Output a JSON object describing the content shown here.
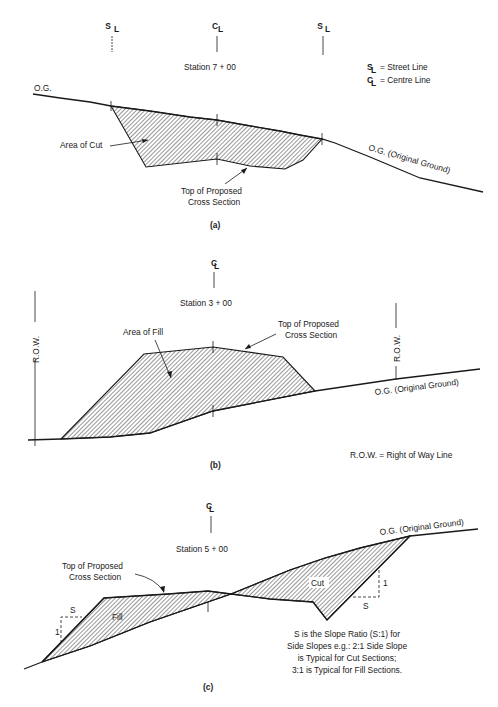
{
  "figure_a": {
    "caption": "(a)",
    "station": "Station 7 + 00",
    "left_marker": "SL",
    "center_marker": "CL",
    "right_marker": "SL",
    "og_left_label": "O.G.",
    "og_right_label": "O.G. (Original Ground)",
    "area_label": "Area of Cut",
    "top_label_line1": "Top of Proposed",
    "top_label_line2": "Cross Section",
    "legend": [
      {
        "symbol": "SL",
        "text": "= Street Line"
      },
      {
        "symbol": "CL",
        "text": "= Centre Line"
      }
    ]
  },
  "figure_b": {
    "caption": "(b)",
    "station": "Station 3 + 00",
    "center_marker": "CL",
    "row_left_label": "R.O.W.",
    "row_right_label": "R.O.W.",
    "area_label": "Area of Fill",
    "top_label_line1": "Top of Proposed",
    "top_label_line2": "Cross Section",
    "og_label": "O.G. (Original Ground)",
    "row_note": "R.O.W. = Right of Way Line"
  },
  "figure_c": {
    "caption": "(c)",
    "station": "Station 5 + 00",
    "center_marker": "CL",
    "og_label": "O.G. (Original Ground)",
    "top_label_line1": "Top of Proposed",
    "top_label_line2": "Cross Section",
    "fill_label": "Fill",
    "cut_label": "Cut",
    "slope_s": "S",
    "slope_1": "1",
    "note_lines": [
      "S is the Slope Ratio (S:1) for",
      "Side Slopes e.g.: 2:1 Side Slope",
      "is Typical for Cut Sections;",
      "3:1 is Typical for Fill Sections."
    ]
  }
}
